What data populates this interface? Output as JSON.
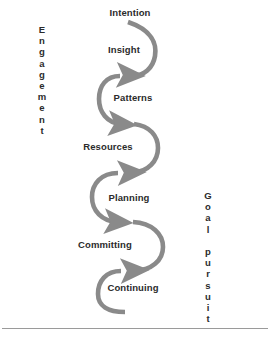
{
  "diagram": {
    "arrow_color": "#8a8a8a",
    "text_color": "#2b2b2b",
    "rule_color": "#9a9a9a",
    "background": "#ffffff",
    "stages": [
      {
        "label": "Intention",
        "x": 130,
        "y": 13
      },
      {
        "label": "Insight",
        "x": 124,
        "y": 50
      },
      {
        "label": "Patterns",
        "x": 133,
        "y": 98
      },
      {
        "label": "Resources",
        "x": 108,
        "y": 147
      },
      {
        "label": "Planning",
        "x": 129,
        "y": 198
      },
      {
        "label": "Committing",
        "x": 105,
        "y": 245
      },
      {
        "label": "Continuing",
        "x": 133,
        "y": 288
      }
    ],
    "axes": [
      {
        "name": "engagement",
        "text": "Engagement",
        "x": 42,
        "y": 24
      },
      {
        "name": "goal-pursuit",
        "text": "Goal pursuit",
        "x": 208,
        "y": 190
      }
    ]
  },
  "chart_data": {
    "type": "diagram",
    "sequence": [
      "Intention",
      "Insight",
      "Patterns",
      "Resources",
      "Planning",
      "Committing",
      "Continuing"
    ],
    "left_axis": "Engagement",
    "right_axis": "Goal pursuit",
    "flow": "serpentine downward arrows alternating right and left"
  }
}
